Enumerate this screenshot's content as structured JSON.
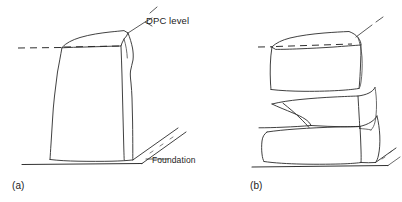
{
  "figure": {
    "type": "technical-line-drawing",
    "title": "",
    "background_color": "#ffffff",
    "ink_color": "#2b2b2b",
    "width": 402,
    "height": 202,
    "annotations": {
      "dpc_label": "DPC level",
      "foundation_label": "Foundation"
    },
    "subfigures": [
      {
        "caption": "(a)",
        "description": "single tall irregular stone block resting on foundation with DPC level dashed line at top"
      },
      {
        "caption": "(b)",
        "description": "three stacked irregular stone blocks with DPC level dashed line at top of uppermost block"
      }
    ]
  }
}
